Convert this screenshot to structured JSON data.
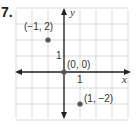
{
  "problem": {
    "number": "7."
  },
  "chart_data": {
    "type": "scatter",
    "title": "",
    "xlabel": "x",
    "ylabel": "y",
    "xlim": [
      -3,
      4
    ],
    "ylim": [
      -3,
      4
    ],
    "grid": true,
    "tick_labels": {
      "x": "1",
      "y": "1"
    },
    "points": [
      {
        "label": "(−1, 2)",
        "x": -1,
        "y": 2
      },
      {
        "label": "(0, 0)",
        "x": 0,
        "y": 0
      },
      {
        "label": "(1, −2)",
        "x": 1,
        "y": -2
      }
    ],
    "colors": {
      "grid": "#d0d0d0",
      "axis": "#222222",
      "point": "#555555"
    }
  }
}
